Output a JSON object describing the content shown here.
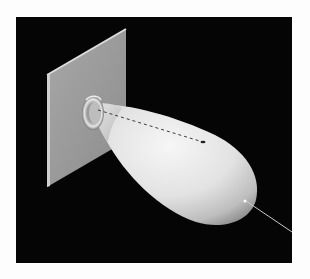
{
  "figure": {
    "colors": {
      "page_background": "#fdfdfd",
      "panel_background": "#050505",
      "ground_plane": "#9a9a9a",
      "ground_plane_edge": "#d8d8d8",
      "lobe_highlight": "#f2f2f2",
      "lobe_shadow": "#8a8a8a",
      "axis_line": "#c8c8c8",
      "dashed_axis": "#444444"
    },
    "elements": {
      "panel": "black-background",
      "ground_plane": "square-plate",
      "feed_ring": "collar",
      "main_lobe": "teardrop-lobe",
      "boresight_axis": "dashed-inside-solid-outside"
    }
  }
}
